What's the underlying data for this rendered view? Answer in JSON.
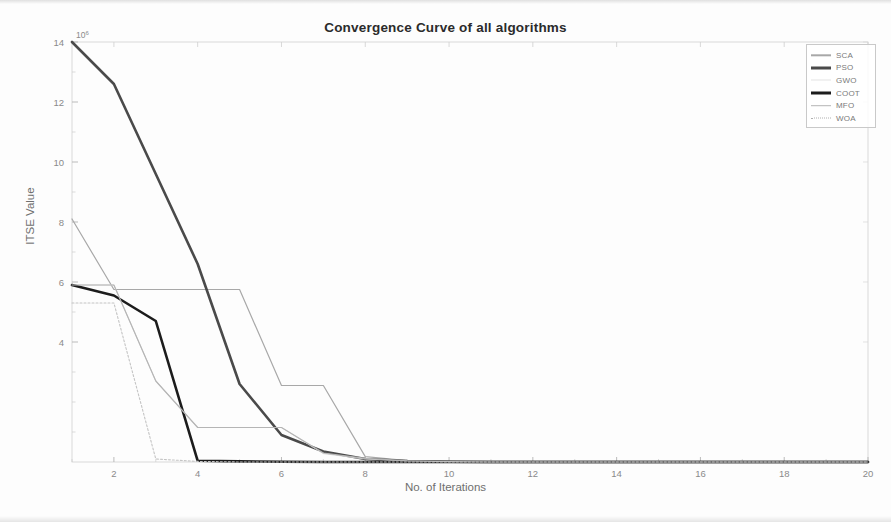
{
  "chart_data": {
    "type": "line",
    "title": "Convergence Curve of all algorithms",
    "xlabel": "No. of Iterations",
    "ylabel": "ITSE Value",
    "y_exponent_label": "10",
    "y_exponent_power": "6",
    "xlim": [
      1,
      20
    ],
    "ylim": [
      0,
      14
    ],
    "xticks": [
      2,
      4,
      6,
      8,
      10,
      12,
      14,
      16,
      18,
      20
    ],
    "yticks": [
      4,
      6,
      8,
      10,
      12,
      14
    ],
    "xtick_labels": [
      "2",
      "4",
      "6",
      "8",
      "10",
      "12",
      "14",
      "16",
      "18",
      "20"
    ],
    "ytick_labels": [
      "4",
      "6",
      "8",
      "10",
      "12",
      "14"
    ],
    "grid": false,
    "legend_position": "top-right",
    "x": [
      1,
      2,
      3,
      4,
      5,
      6,
      7,
      8,
      9,
      10,
      11,
      12,
      13,
      14,
      15,
      16,
      17,
      18,
      19,
      20
    ],
    "series": [
      {
        "name": "SCA",
        "color": "#a8a8a8",
        "width": 1.2,
        "dash": "none",
        "values": [
          8.1,
          5.75,
          5.75,
          5.75,
          5.75,
          2.55,
          2.55,
          0.18,
          0.05,
          0.02,
          0.01,
          0.01,
          0.0,
          0.0,
          0.0,
          0.0,
          0.0,
          0.0,
          0.0,
          0.0
        ]
      },
      {
        "name": "PSO",
        "color": "#4a4a4a",
        "width": 2.6,
        "dash": "none",
        "values": [
          14.0,
          12.6,
          9.6,
          6.6,
          2.6,
          0.9,
          0.35,
          0.1,
          0.03,
          0.01,
          0.0,
          0.0,
          0.0,
          0.0,
          0.0,
          0.0,
          0.0,
          0.0,
          0.0,
          0.0
        ]
      },
      {
        "name": "GWO",
        "color": "#d6d6d6",
        "width": 1.0,
        "dash": "none",
        "values": [
          5.9,
          5.9,
          2.7,
          1.15,
          1.15,
          1.15,
          0.28,
          0.1,
          0.03,
          0.01,
          0.0,
          0.0,
          0.0,
          0.0,
          0.0,
          0.0,
          0.0,
          0.0,
          0.0,
          0.0
        ]
      },
      {
        "name": "COOT",
        "color": "#1c1c1c",
        "width": 2.6,
        "dash": "none",
        "values": [
          5.9,
          5.55,
          4.7,
          0.04,
          0.02,
          0.01,
          0.0,
          0.0,
          0.0,
          0.0,
          0.0,
          0.0,
          0.0,
          0.0,
          0.0,
          0.0,
          0.0,
          0.0,
          0.0,
          0.0
        ]
      },
      {
        "name": "MFO",
        "color": "#b5b5b5",
        "width": 1.2,
        "dash": "none",
        "values": [
          5.9,
          5.9,
          2.7,
          1.15,
          1.15,
          1.15,
          0.3,
          0.12,
          0.04,
          0.01,
          0.0,
          0.0,
          0.0,
          0.0,
          0.0,
          0.0,
          0.0,
          0.0,
          0.0,
          0.0
        ]
      },
      {
        "name": "WOA",
        "color": "#c4c4c4",
        "width": 1.1,
        "dash": "2 2",
        "values": [
          5.3,
          5.3,
          0.1,
          0.02,
          0.0,
          0.0,
          0.0,
          0.0,
          0.0,
          0.0,
          0.0,
          0.0,
          0.0,
          0.0,
          0.0,
          0.0,
          0.0,
          0.0,
          0.0,
          0.0
        ]
      }
    ],
    "legend_entries": [
      {
        "label": "SCA",
        "color": "#a8a8a8",
        "width": 1.4,
        "dash": "none"
      },
      {
        "label": "PSO",
        "color": "#4a4a4a",
        "width": 3.0,
        "dash": "none"
      },
      {
        "label": "GWO",
        "color": "#e4e4e4",
        "width": 1.0,
        "dash": "none"
      },
      {
        "label": "COOT",
        "color": "#1c1c1c",
        "width": 3.0,
        "dash": "none"
      },
      {
        "label": "MFO",
        "color": "#b5b5b5",
        "width": 1.6,
        "dash": "none"
      },
      {
        "label": "WOA",
        "color": "#b0b0b0",
        "width": 1.6,
        "dash": "dotted"
      }
    ]
  }
}
